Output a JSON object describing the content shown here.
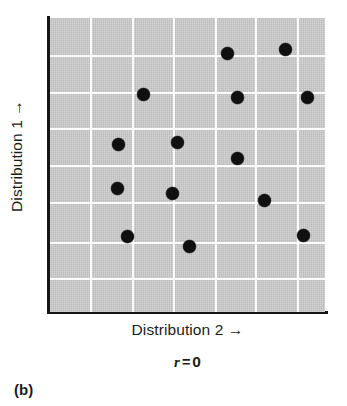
{
  "figure": {
    "panel_label": "(b)",
    "r_symbol": "r",
    "r_equals": "=",
    "r_number": "0",
    "colors": {
      "plot_fill": "#c3c3c3",
      "gridline": "#fdfdfd",
      "axis": "#151515",
      "marker": "#101010",
      "text": "#1c1c1c",
      "background": "#ffffff"
    }
  },
  "chart_data": {
    "type": "scatter",
    "title": "",
    "subtitle": "",
    "xlabel": "Distribution 2 →",
    "ylabel": "Distribution 1 →",
    "annotation": "r = 0",
    "correlation_r": 0,
    "grid": true,
    "legend_position": "none",
    "xtick_labels": [],
    "ytick_labels": [],
    "xlim": [
      0,
      7
    ],
    "ylim": [
      0,
      8
    ],
    "x_gridlines": [
      1,
      2,
      3,
      4,
      5,
      6
    ],
    "y_gridlines": [
      1,
      2,
      3,
      4,
      5,
      6,
      7
    ],
    "n_points": 14,
    "points": [
      {
        "x": 4.52,
        "y": 7.05
      },
      {
        "x": 6.0,
        "y": 7.18
      },
      {
        "x": 2.37,
        "y": 5.9
      },
      {
        "x": 4.77,
        "y": 5.81
      },
      {
        "x": 6.55,
        "y": 5.81
      },
      {
        "x": 1.74,
        "y": 4.55
      },
      {
        "x": 3.24,
        "y": 4.6
      },
      {
        "x": 4.77,
        "y": 4.17
      },
      {
        "x": 1.72,
        "y": 3.36
      },
      {
        "x": 3.11,
        "y": 3.23
      },
      {
        "x": 5.46,
        "y": 3.03
      },
      {
        "x": 1.96,
        "y": 2.04
      },
      {
        "x": 3.55,
        "y": 1.78
      },
      {
        "x": 6.45,
        "y": 2.07
      }
    ],
    "points_px": [
      {
        "cx": 227,
        "cy": 53
      },
      {
        "cx": 285,
        "cy": 49
      },
      {
        "cx": 143,
        "cy": 94
      },
      {
        "cx": 237,
        "cy": 97
      },
      {
        "cx": 307,
        "cy": 97
      },
      {
        "cx": 118,
        "cy": 144
      },
      {
        "cx": 177,
        "cy": 142
      },
      {
        "cx": 237,
        "cy": 158
      },
      {
        "cx": 117,
        "cy": 188
      },
      {
        "cx": 172,
        "cy": 193
      },
      {
        "cx": 264,
        "cy": 200
      },
      {
        "cx": 127,
        "cy": 236
      },
      {
        "cx": 189,
        "cy": 246
      },
      {
        "cx": 303,
        "cy": 235
      }
    ],
    "x_gridlines_px": [
      90,
      132,
      173,
      215,
      255,
      297
    ],
    "y_gridlines_px": [
      55,
      92,
      128,
      165,
      202,
      242,
      278
    ]
  }
}
